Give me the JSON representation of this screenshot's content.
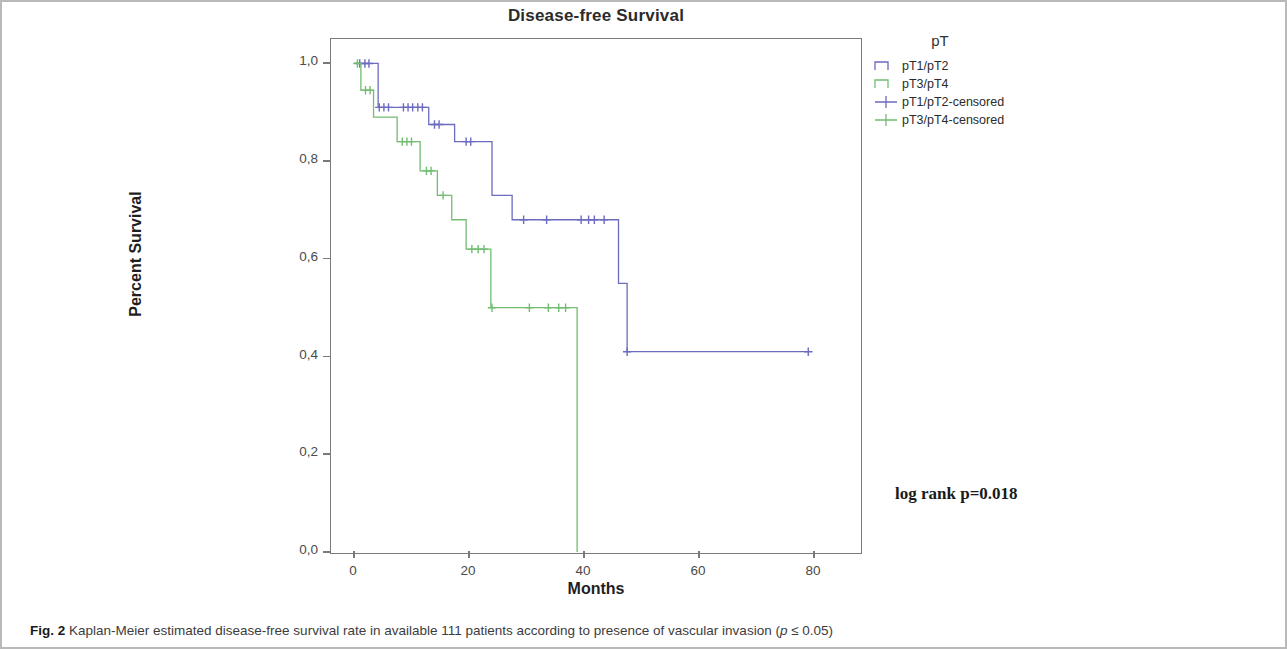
{
  "figure": {
    "caption_prefix": "Fig. 2",
    "caption_text": " Kaplan-Meier estimated disease-free survival rate in available 111 patients according to presence of vascular invasion (",
    "caption_italic": "p",
    "caption_suffix": " ≤ 0.05)"
  },
  "annotation": {
    "log_rank": "log rank p=0.018"
  },
  "legend": {
    "title": "pT",
    "items": [
      {
        "label": "pT1/pT2",
        "color": "#6b6bbf",
        "marker": "step"
      },
      {
        "label": "pT3/pT4",
        "color": "#72bd72",
        "marker": "step"
      },
      {
        "label": "pT1/pT2-censored",
        "color": "#6b6bbf",
        "marker": "cross"
      },
      {
        "label": "pT3/pT4-censored",
        "color": "#72bd72",
        "marker": "cross"
      }
    ]
  },
  "chart_data": {
    "type": "line",
    "title": "Disease-free Survival",
    "xlabel": "Months",
    "ylabel": "Percent Survival",
    "xlim": [
      -4,
      88
    ],
    "ylim": [
      0.0,
      1.05
    ],
    "xticks": [
      0,
      20,
      40,
      60,
      80
    ],
    "xtick_labels": [
      "0",
      "20",
      "40",
      "60",
      "80"
    ],
    "yticks": [
      0.0,
      0.2,
      0.4,
      0.6,
      0.8,
      1.0
    ],
    "ytick_labels": [
      "0,0",
      "0,2",
      "0,4",
      "0,6",
      "0,8",
      "1,0"
    ],
    "grid": false,
    "legend_position": "right",
    "series": [
      {
        "name": "pT1/pT2",
        "color": "#6b6bbf",
        "step": "post",
        "points": [
          [
            0,
            1.0
          ],
          [
            4.2,
            1.0
          ],
          [
            4.2,
            0.91
          ],
          [
            13.0,
            0.91
          ],
          [
            13.0,
            0.875
          ],
          [
            17.5,
            0.875
          ],
          [
            17.5,
            0.84
          ],
          [
            24.0,
            0.84
          ],
          [
            24.0,
            0.73
          ],
          [
            27.5,
            0.73
          ],
          [
            27.5,
            0.68
          ],
          [
            46.0,
            0.68
          ],
          [
            46.0,
            0.55
          ],
          [
            47.5,
            0.55
          ],
          [
            47.5,
            0.41
          ],
          [
            79.0,
            0.41
          ]
        ],
        "censored": [
          [
            1.0,
            1.0
          ],
          [
            1.9,
            1.0
          ],
          [
            2.6,
            1.0
          ],
          [
            4.4,
            0.91
          ],
          [
            5.2,
            0.91
          ],
          [
            6.0,
            0.91
          ],
          [
            8.6,
            0.91
          ],
          [
            9.4,
            0.91
          ],
          [
            10.2,
            0.91
          ],
          [
            11.1,
            0.91
          ],
          [
            11.9,
            0.91
          ],
          [
            14.0,
            0.875
          ],
          [
            14.8,
            0.875
          ],
          [
            19.5,
            0.84
          ],
          [
            20.3,
            0.84
          ],
          [
            29.5,
            0.68
          ],
          [
            33.5,
            0.68
          ],
          [
            39.5,
            0.68
          ],
          [
            40.8,
            0.68
          ],
          [
            41.8,
            0.68
          ],
          [
            43.5,
            0.68
          ],
          [
            47.5,
            0.41
          ],
          [
            79.0,
            0.41
          ]
        ]
      },
      {
        "name": "pT3/pT4",
        "color": "#72bd72",
        "step": "post",
        "points": [
          [
            0,
            1.0
          ],
          [
            1.2,
            1.0
          ],
          [
            1.2,
            0.945
          ],
          [
            3.4,
            0.945
          ],
          [
            3.4,
            0.89
          ],
          [
            7.5,
            0.89
          ],
          [
            7.5,
            0.84
          ],
          [
            11.5,
            0.84
          ],
          [
            11.5,
            0.78
          ],
          [
            14.5,
            0.78
          ],
          [
            14.5,
            0.73
          ],
          [
            17.0,
            0.73
          ],
          [
            17.0,
            0.68
          ],
          [
            19.5,
            0.68
          ],
          [
            19.5,
            0.62
          ],
          [
            23.8,
            0.62
          ],
          [
            23.8,
            0.5
          ],
          [
            38.8,
            0.5
          ],
          [
            38.8,
            0.0
          ]
        ],
        "censored": [
          [
            0.6,
            1.0
          ],
          [
            2.0,
            0.945
          ],
          [
            2.8,
            0.945
          ],
          [
            8.4,
            0.84
          ],
          [
            9.2,
            0.84
          ],
          [
            10.0,
            0.84
          ],
          [
            12.6,
            0.78
          ],
          [
            13.4,
            0.78
          ],
          [
            15.5,
            0.73
          ],
          [
            20.5,
            0.62
          ],
          [
            21.6,
            0.62
          ],
          [
            22.6,
            0.62
          ],
          [
            24.0,
            0.5
          ],
          [
            30.5,
            0.5
          ],
          [
            33.8,
            0.5
          ],
          [
            35.6,
            0.5
          ],
          [
            36.8,
            0.5
          ]
        ]
      }
    ]
  }
}
